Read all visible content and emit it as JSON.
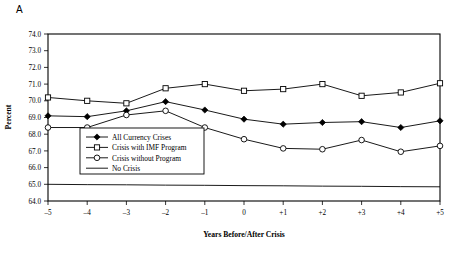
{
  "panel": {
    "label": "A"
  },
  "chart_data": {
    "type": "line",
    "title": "",
    "xlabel": "Years Before/After Crisis",
    "ylabel": "Percent",
    "categories": [
      "-5",
      "-4",
      "-3",
      "-2",
      "-1",
      "0",
      "+1",
      "+2",
      "+3",
      "+4",
      "+5"
    ],
    "x": [
      -5,
      -4,
      -3,
      -2,
      -1,
      0,
      1,
      2,
      3,
      4,
      5
    ],
    "xtick_labels": [
      "–5",
      "–4",
      "–3",
      "–2",
      "–1",
      "0",
      "+1",
      "+2",
      "+3",
      "+4",
      "+5"
    ],
    "ylim": [
      64.0,
      74.0
    ],
    "ytick_values": [
      64.0,
      65.0,
      66.0,
      67.0,
      68.0,
      69.0,
      70.0,
      71.0,
      72.0,
      73.0,
      74.0
    ],
    "ytick_labels": [
      "64.0",
      "65.0",
      "66.0",
      "67.0",
      "68.0",
      "69.0",
      "70.0",
      "71.0",
      "72.0",
      "73.0",
      "74.0"
    ],
    "grid": false,
    "legend_position": "inside-lower-left",
    "series": [
      {
        "name": "All Currency Crises",
        "marker": "filled-diamond",
        "values": [
          69.1,
          69.05,
          69.4,
          69.95,
          69.45,
          68.9,
          68.6,
          68.7,
          68.75,
          68.4,
          68.8
        ]
      },
      {
        "name": "Crisis with IMF Program",
        "marker": "open-square",
        "values": [
          70.2,
          70.0,
          69.85,
          70.75,
          71.0,
          70.6,
          70.7,
          71.0,
          70.3,
          70.5,
          71.05
        ]
      },
      {
        "name": "Crisis without Program",
        "marker": "open-circle",
        "values": [
          68.4,
          68.4,
          69.15,
          69.4,
          68.4,
          67.7,
          67.15,
          67.1,
          67.65,
          66.95,
          67.3
        ]
      },
      {
        "name": "No Crisis",
        "marker": "none",
        "values": [
          65.0,
          64.98,
          64.97,
          64.95,
          64.94,
          64.92,
          64.91,
          64.89,
          64.88,
          64.86,
          64.85
        ]
      }
    ]
  },
  "colors": {
    "axis": "#000000",
    "series": "#000000",
    "background": "#ffffff"
  }
}
